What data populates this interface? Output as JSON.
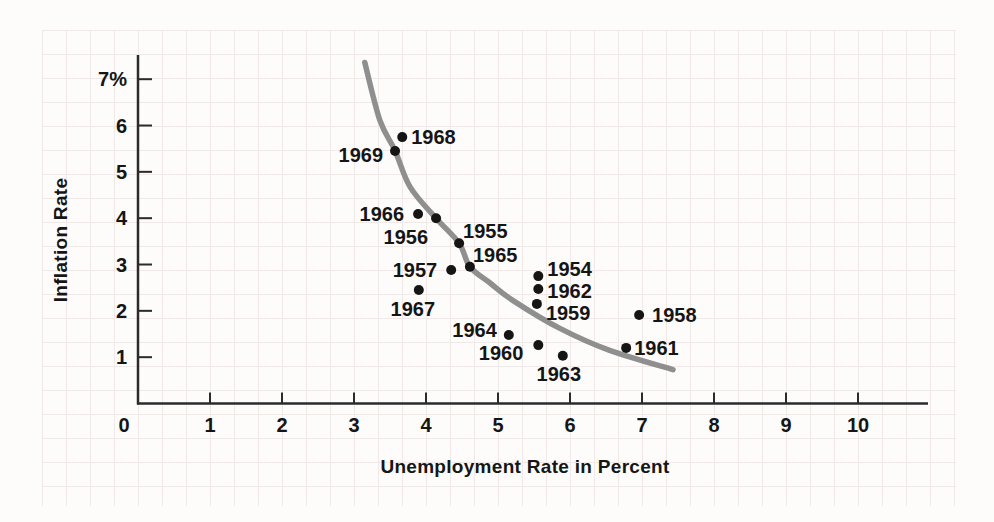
{
  "figure": {
    "background": "#fdfcfb",
    "grid_color": "#f0e9e8",
    "axis_color": "#2b2b2b",
    "text_color": "#151515",
    "curve_color": "#8f8f8f",
    "dot_color": "#151515"
  },
  "chart_data": {
    "type": "scatter",
    "title": "",
    "xlabel": "Unemployment Rate in Percent",
    "ylabel": "Inflation Rate",
    "xlim": [
      0,
      11
    ],
    "ylim": [
      0,
      7.5
    ],
    "grid": true,
    "legend": null,
    "x_ticks": [
      1,
      2,
      3,
      4,
      5,
      6,
      7,
      8,
      9,
      10
    ],
    "x_tick_labels": [
      "1",
      "2",
      "3",
      "4",
      "5",
      "6",
      "7",
      "8",
      "9",
      "10"
    ],
    "y_ticks": [
      1,
      2,
      3,
      4,
      5,
      6,
      7
    ],
    "y_tick_labels": [
      "1",
      "2",
      "3",
      "4",
      "5",
      "6",
      "7%"
    ],
    "origin_label": "0",
    "points": [
      {
        "year": "1954",
        "x": 5.56,
        "y": 2.75,
        "label_dx": 9,
        "label_dy": -7,
        "label_anchor": "start"
      },
      {
        "year": "1955",
        "x": 4.46,
        "y": 3.46,
        "label_dx": 4,
        "label_dy": -12,
        "label_anchor": "start"
      },
      {
        "year": "1956",
        "x": 4.14,
        "y": 4.0,
        "label_dx": -8,
        "label_dy": 19,
        "label_anchor": "end"
      },
      {
        "year": "1957",
        "x": 4.35,
        "y": 2.88,
        "label_dx": -14,
        "label_dy": 0,
        "label_anchor": "end"
      },
      {
        "year": "1958",
        "x": 6.96,
        "y": 1.91,
        "label_dx": 13,
        "label_dy": 0,
        "label_anchor": "start"
      },
      {
        "year": "1959",
        "x": 5.54,
        "y": 2.15,
        "label_dx": 9,
        "label_dy": 9,
        "label_anchor": "start"
      },
      {
        "year": "1960",
        "x": 5.56,
        "y": 1.26,
        "label_dx": -15,
        "label_dy": 8,
        "label_anchor": "end"
      },
      {
        "year": "1961",
        "x": 6.78,
        "y": 1.2,
        "label_dx": 8,
        "label_dy": 0,
        "label_anchor": "start"
      },
      {
        "year": "1962",
        "x": 5.56,
        "y": 2.47,
        "label_dx": 9,
        "label_dy": 2,
        "label_anchor": "start"
      },
      {
        "year": "1963",
        "x": 5.9,
        "y": 1.03,
        "label_dx": -4,
        "label_dy": 18,
        "label_anchor": "middle"
      },
      {
        "year": "1964",
        "x": 5.15,
        "y": 1.48,
        "label_dx": -12,
        "label_dy": -5,
        "label_anchor": "end"
      },
      {
        "year": "1965",
        "x": 4.61,
        "y": 2.95,
        "label_dx": 3,
        "label_dy": -12,
        "label_anchor": "start"
      },
      {
        "year": "1966",
        "x": 3.89,
        "y": 4.09,
        "label_dx": -14,
        "label_dy": 0,
        "label_anchor": "end"
      },
      {
        "year": "1967",
        "x": 3.9,
        "y": 2.45,
        "label_dx": -6,
        "label_dy": 19,
        "label_anchor": "middle"
      },
      {
        "year": "1968",
        "x": 3.67,
        "y": 5.75,
        "label_dx": 9,
        "label_dy": 0,
        "label_anchor": "start"
      },
      {
        "year": "1969",
        "x": 3.57,
        "y": 5.45,
        "label_dx": -12,
        "label_dy": 4,
        "label_anchor": "end"
      }
    ],
    "curve": {
      "name": "phillips-curve",
      "points": [
        [
          3.15,
          7.36
        ],
        [
          3.36,
          6.11
        ],
        [
          3.57,
          5.46
        ],
        [
          3.78,
          4.67
        ],
        [
          4.14,
          4.0
        ],
        [
          4.46,
          3.46
        ],
        [
          4.61,
          2.95
        ],
        [
          4.89,
          2.6
        ],
        [
          5.21,
          2.22
        ],
        [
          5.86,
          1.62
        ],
        [
          6.56,
          1.14
        ],
        [
          7.43,
          0.73
        ]
      ]
    }
  }
}
